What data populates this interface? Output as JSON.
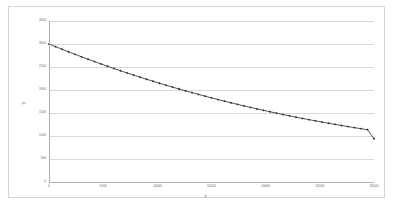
{
  "chart_data": {
    "type": "line",
    "title": "",
    "xlabel": "q",
    "ylabel": "pv",
    "xlim": [
      0,
      30000
    ],
    "ylim": [
      0,
      3500
    ],
    "grid": true,
    "legend": false,
    "series_name": "pv",
    "line_color": "#3f3f3f",
    "marker": "diamond",
    "marker_color": "#2e2e2e",
    "gridline_color": "#d9d9d9",
    "axis_color": "#b0b0b0",
    "x_ticks": [
      "0",
      "5000",
      "10000",
      "15000",
      "20000",
      "25000",
      "30000"
    ],
    "x_tick_values": [
      0,
      5000,
      10000,
      15000,
      20000,
      25000,
      30000
    ],
    "y_ticks": [
      "0",
      "500",
      "1000",
      "1500",
      "2000",
      "2500",
      "3000",
      "3500"
    ],
    "y_tick_values": [
      0,
      500,
      1000,
      1500,
      2000,
      2500,
      3000,
      3500
    ],
    "x": [
      0,
      600,
      1200,
      1800,
      2400,
      3000,
      3600,
      4200,
      4800,
      5400,
      6000,
      6600,
      7200,
      7800,
      8400,
      9000,
      9600,
      10200,
      10800,
      11400,
      12000,
      12600,
      13200,
      13800,
      14400,
      15000,
      15600,
      16200,
      16800,
      17400,
      18000,
      18600,
      19200,
      19800,
      20400,
      21000,
      21600,
      22200,
      22800,
      23400,
      24000,
      24600,
      25200,
      25800,
      26400,
      27000,
      27600,
      28200,
      28800,
      29400,
      30000
    ],
    "values": [
      3000,
      2942,
      2886,
      2830,
      2776,
      2722,
      2669,
      2617,
      2566,
      2516,
      2467,
      2419,
      2371,
      2325,
      2279,
      2234,
      2190,
      2147,
      2104,
      2063,
      2022,
      1982,
      1942,
      1904,
      1866,
      1829,
      1792,
      1757,
      1722,
      1688,
      1654,
      1621,
      1589,
      1558,
      1527,
      1497,
      1467,
      1438,
      1410,
      1382,
      1355,
      1329,
      1303,
      1277,
      1253,
      1228,
      1205,
      1181,
      1159,
      1137,
      940
    ]
  }
}
